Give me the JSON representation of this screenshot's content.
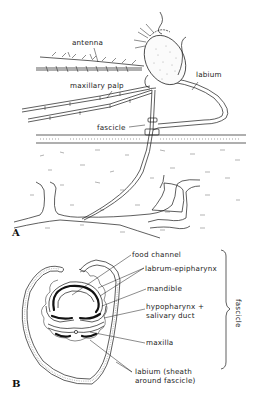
{
  "figure": {
    "colors": {
      "ink": "#1a1a1a",
      "background": "#ffffff",
      "stipple": "#888888"
    }
  },
  "panel_a": {
    "letter": "A",
    "labels": {
      "antenna": "antenna",
      "maxillary_palp": "maxillary palp",
      "labium": "labium",
      "fascicle": "fascicle"
    }
  },
  "panel_b": {
    "letter": "B",
    "labels": {
      "food_channel": "food channel",
      "labrum_epipharynx": "labrum-epipharynx",
      "mandible": "mandible",
      "hypopharynx_line1": "hypopharynx +",
      "hypopharynx_line2": "salivary duct",
      "maxilla": "maxilla",
      "labium_line1": "labium (sheath",
      "labium_line2": "around fascicle)"
    },
    "bracket_label": "fascicle"
  }
}
